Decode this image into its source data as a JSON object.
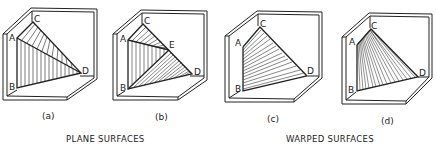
{
  "figure": {
    "panels": [
      {
        "id": "a",
        "caption": "(a)",
        "points": {
          "A": "A",
          "B": "B",
          "C": "C",
          "D": "D"
        },
        "surface_type": "plane",
        "hatching": "vertical lines (triangle ABD) and diagonal lines (triangle ACD)"
      },
      {
        "id": "b",
        "caption": "(b)",
        "points": {
          "A": "A",
          "B": "B",
          "C": "C",
          "D": "D",
          "E": "E"
        },
        "surface_type": "plane",
        "hatching": "diagonal (ACE), vertical (ABE), diagonal (BED)"
      },
      {
        "id": "c",
        "caption": "(c)",
        "points": {
          "A": "A",
          "B": "B",
          "C": "C",
          "D": "D"
        },
        "surface_type": "warped",
        "hatching": "straight-line elements between AB and CD"
      },
      {
        "id": "d",
        "caption": "(d)",
        "points": {
          "A": "A",
          "B": "B",
          "C": "C",
          "D": "D"
        },
        "surface_type": "warped",
        "hatching": "fan of lines from AC to BD"
      }
    ],
    "group_labels": {
      "plane": "PLANE SURFACES",
      "warped": "WARPED SURFACES"
    },
    "colors": {
      "line": "#222222",
      "background": "#ffffff"
    }
  }
}
